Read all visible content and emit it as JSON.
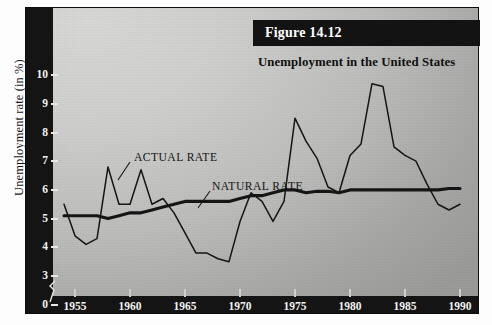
{
  "figure": {
    "number_label": "Figure 14.12",
    "subtitle": "Unemployment in the United States",
    "y_axis_title": "Unemployment rate (in %)"
  },
  "colors": {
    "axis_band": "#141414",
    "plot_light": "#d8d8d6",
    "plot_dark": "#9a9a98",
    "line": "#151515",
    "tick_text": "#f2f2f0",
    "page": "#ffffff"
  },
  "annotations": [
    {
      "name": "actual-rate",
      "text": "ACTUAL RATE",
      "x": 108,
      "y": 143
    },
    {
      "name": "natural-rate",
      "text": "NATURAL RATE",
      "x": 186,
      "y": 172
    }
  ],
  "chart_data": {
    "type": "line",
    "title": "Unemployment in the United States",
    "xlabel": "",
    "ylabel": "Unemployment rate (in %)",
    "xlim": [
      1954,
      1990
    ],
    "ylim": [
      3,
      10.3
    ],
    "y_axis_break_below": 3,
    "grid": false,
    "legend": "inline-annotations",
    "xticks": [
      1955,
      1960,
      1965,
      1970,
      1975,
      1980,
      1985,
      1990
    ],
    "yticks": [
      0,
      3,
      4,
      5,
      6,
      7,
      8,
      9,
      10
    ],
    "x": [
      1954,
      1955,
      1956,
      1957,
      1958,
      1959,
      1960,
      1961,
      1962,
      1963,
      1964,
      1965,
      1966,
      1967,
      1968,
      1969,
      1970,
      1971,
      1972,
      1973,
      1974,
      1975,
      1976,
      1977,
      1978,
      1979,
      1980,
      1981,
      1982,
      1983,
      1984,
      1985,
      1986,
      1987,
      1988,
      1989,
      1990
    ],
    "series": [
      {
        "name": "ACTUAL RATE",
        "style": "thin",
        "values": [
          5.5,
          4.4,
          4.1,
          4.3,
          6.8,
          5.5,
          5.5,
          6.7,
          5.5,
          5.7,
          5.2,
          4.5,
          3.8,
          3.8,
          3.6,
          3.5,
          4.9,
          5.9,
          5.6,
          4.9,
          5.6,
          8.5,
          7.7,
          7.1,
          6.1,
          5.9,
          7.2,
          7.6,
          9.7,
          9.6,
          7.5,
          7.2,
          7.0,
          6.2,
          5.5,
          5.3,
          5.5
        ]
      },
      {
        "name": "NATURAL RATE",
        "style": "thick",
        "values": [
          5.1,
          5.1,
          5.1,
          5.1,
          5.0,
          5.1,
          5.2,
          5.2,
          5.3,
          5.4,
          5.5,
          5.6,
          5.6,
          5.6,
          5.6,
          5.6,
          5.7,
          5.8,
          5.8,
          5.9,
          6.0,
          6.0,
          5.9,
          5.95,
          5.95,
          5.9,
          6.0,
          6.0,
          6.0,
          6.0,
          6.0,
          6.0,
          6.0,
          6.0,
          6.0,
          6.05,
          6.05
        ]
      }
    ]
  }
}
